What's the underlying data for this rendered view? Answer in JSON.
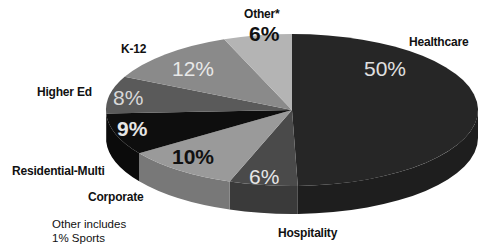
{
  "chart_data": {
    "type": "pie",
    "style": "3d-exploded-none",
    "title": "",
    "categories": [
      "Healthcare",
      "Hospitality",
      "Corporate",
      "Residential-Multi",
      "Higher Ed",
      "K-12",
      "Other*"
    ],
    "values": [
      50,
      6,
      10,
      9,
      8,
      12,
      6
    ],
    "value_labels": [
      "50%",
      "6%",
      "10%",
      "9%",
      "8%",
      "12%",
      "6%"
    ],
    "colors": [
      "#262626",
      "#4a4a4a",
      "#9a9a9a",
      "#0e0e0e",
      "#5a5a5a",
      "#8a8a8a",
      "#b4b4b4"
    ],
    "label_colors": [
      "#e0e0e0",
      "#e6e6e6",
      "#111111",
      "#e6e6e6",
      "#d8d8d8",
      "#e8e8e8",
      "#111111"
    ],
    "legend": "none",
    "annotation": "Other includes 1% Sports"
  },
  "labels": {
    "healthcare": "Healthcare",
    "hospitality": "Hospitality",
    "corporate": "Corporate",
    "residential": "Residential-Multi",
    "higher_ed": "Higher Ed",
    "k12": "K-12",
    "other": "Other*"
  },
  "percents": {
    "healthcare": "50%",
    "hospitality": "6%",
    "corporate": "10%",
    "residential": "9%",
    "higher_ed": "8%",
    "k12": "12%",
    "other": "6%"
  },
  "note": {
    "line1": "Other includes",
    "line2": "1%  Sports"
  }
}
